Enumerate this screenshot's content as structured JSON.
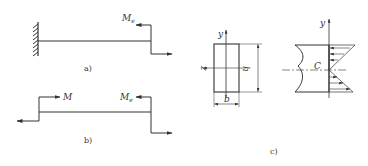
{
  "figure": {
    "panel_a": {
      "caption": "a)",
      "moment_label": "M",
      "moment_subscript": "e",
      "support": "fixed-wall-left"
    },
    "panel_b": {
      "caption": "b)",
      "left_moment_label": "M",
      "right_moment_label": "M",
      "right_moment_subscript": "e"
    },
    "panel_c": {
      "caption": "c)",
      "section": {
        "y_axis_label": "y",
        "z_axis_label": "z",
        "height_label": "h",
        "width_label": "b"
      },
      "stress": {
        "y_axis_label": "y",
        "centroid_label": "C"
      }
    }
  },
  "colors": {
    "line": "#333333",
    "background": "#ffffff"
  }
}
